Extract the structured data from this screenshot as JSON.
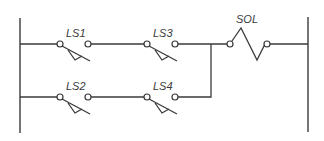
{
  "diagram": {
    "type": "ladder-logic",
    "colors": {
      "line": "#3a3a3a",
      "background": "#ffffff"
    },
    "rails": {
      "left_x": 20,
      "right_x": 308,
      "top_y": 18,
      "bottom_y": 133
    },
    "rungs": [
      {
        "y": 44,
        "elements": [
          {
            "type": "limit-switch-NO",
            "label": "LS1"
          },
          {
            "type": "limit-switch-NO",
            "label": "LS3"
          }
        ]
      },
      {
        "y": 97,
        "elements": [
          {
            "type": "limit-switch-NO",
            "label": "LS2"
          },
          {
            "type": "limit-switch-NO",
            "label": "LS4"
          }
        ]
      }
    ],
    "output": {
      "type": "solenoid",
      "label": "SOL"
    },
    "labels": {
      "ls1": "LS1",
      "ls2": "LS2",
      "ls3": "LS3",
      "ls4": "LS4",
      "sol": "SOL"
    }
  }
}
